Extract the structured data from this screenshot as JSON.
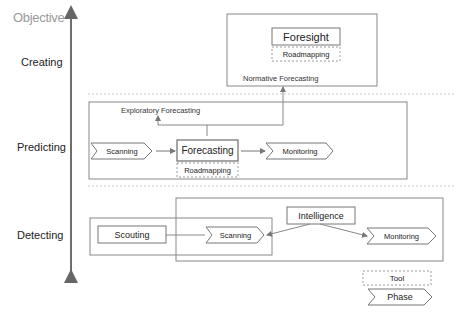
{
  "axis": {
    "title": "Objective"
  },
  "levels": [
    {
      "label": "Creating"
    },
    {
      "label": "Predicting"
    },
    {
      "label": "Detecting"
    }
  ],
  "creating": {
    "main_box": "Foresight",
    "tool": "Roadmapping",
    "caption": "Normative Forecasting"
  },
  "predicting": {
    "caption": "Exploratory Forecasting",
    "phase_in": "Scanning",
    "main_box": "Forecasting",
    "tool": "Roadmapping",
    "phase_out": "Monitoring"
  },
  "detecting": {
    "scouting": "Scouting",
    "phase_scan": "Scanning",
    "intelligence": "Intelligence",
    "phase_monitor": "Monitoring"
  },
  "legend": {
    "tool": "Tool",
    "phase": "Phase"
  },
  "colors": {
    "line": "#8c8c8c",
    "box_border": "#777777",
    "dashed": "#9a9a9a",
    "axis": "#6e6e6e",
    "separator": "#c8c8c8"
  }
}
